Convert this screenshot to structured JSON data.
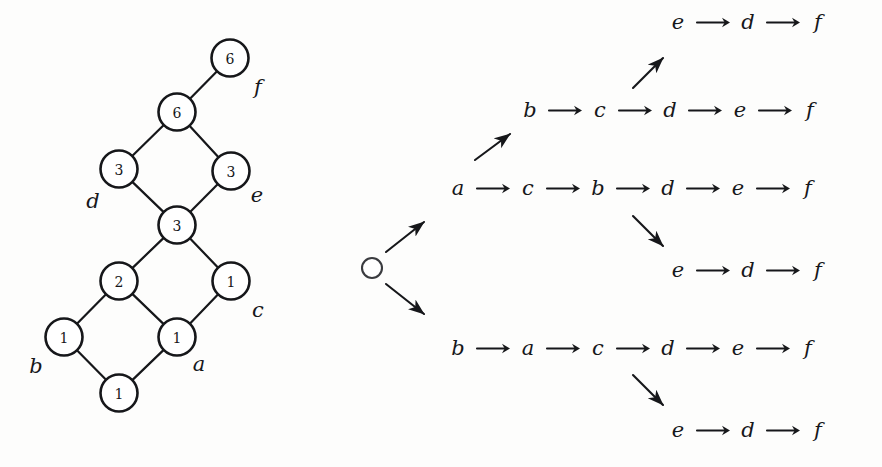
{
  "figure": {
    "caption": "",
    "ink_color": "#16171a",
    "background_color": "#fdfdfc"
  },
  "lattice": {
    "name": "counting-lattice",
    "nodes": [
      {
        "id": "n6top",
        "value": "6",
        "cx": 230,
        "cy": 58
      },
      {
        "id": "n6",
        "value": "6",
        "cx": 177,
        "cy": 112
      },
      {
        "id": "n3left",
        "value": "3",
        "cx": 119,
        "cy": 169
      },
      {
        "id": "n3right",
        "value": "3",
        "cx": 231,
        "cy": 171
      },
      {
        "id": "n3mid",
        "value": "3",
        "cx": 177,
        "cy": 225
      },
      {
        "id": "n2",
        "value": "2",
        "cx": 119,
        "cy": 281
      },
      {
        "id": "n1c",
        "value": "1",
        "cx": 231,
        "cy": 281
      },
      {
        "id": "n1b",
        "value": "1",
        "cx": 64,
        "cy": 337
      },
      {
        "id": "n1a",
        "value": "1",
        "cx": 177,
        "cy": 337
      },
      {
        "id": "n1bot",
        "value": "1",
        "cx": 119,
        "cy": 393
      }
    ],
    "edges": [
      [
        "n1bot",
        "n1b"
      ],
      [
        "n1bot",
        "n1a"
      ],
      [
        "n1b",
        "n2"
      ],
      [
        "n1a",
        "n2"
      ],
      [
        "n1a",
        "n1c"
      ],
      [
        "n2",
        "n3mid"
      ],
      [
        "n1c",
        "n3mid"
      ],
      [
        "n3mid",
        "n3left"
      ],
      [
        "n3mid",
        "n3right"
      ],
      [
        "n3left",
        "n6"
      ],
      [
        "n3right",
        "n6"
      ],
      [
        "n6",
        "n6top"
      ]
    ],
    "element_labels": [
      {
        "text": "b",
        "x": 36,
        "y": 366
      },
      {
        "text": "a",
        "x": 199,
        "y": 364
      },
      {
        "text": "c",
        "x": 258,
        "y": 310
      },
      {
        "text": "d",
        "x": 93,
        "y": 201
      },
      {
        "text": "e",
        "x": 257,
        "y": 195
      },
      {
        "text": "f",
        "x": 258,
        "y": 87
      }
    ]
  },
  "tree": {
    "name": "linear-extension-tree",
    "root": {
      "label": "",
      "cx": 42,
      "cy": 268,
      "r": 10
    },
    "rows": [
      {
        "id": "row-e-d-f-top",
        "items": [
          "e",
          "d",
          "f"
        ],
        "left": 338,
        "top": 22
      },
      {
        "id": "row-b-c-d-e-f",
        "items": [
          "b",
          "c",
          "d",
          "e",
          "f"
        ],
        "left": 190,
        "top": 110
      },
      {
        "id": "row-a-c-b-d-e-f",
        "items": [
          "a",
          "c",
          "b",
          "d",
          "e",
          "f"
        ],
        "left": 118,
        "top": 188
      },
      {
        "id": "row-e-d-f-mid",
        "items": [
          "e",
          "d",
          "f"
        ],
        "left": 338,
        "top": 270
      },
      {
        "id": "row-b-a-c-d-e-f",
        "items": [
          "b",
          "a",
          "c",
          "d",
          "e",
          "f"
        ],
        "left": 118,
        "top": 348
      },
      {
        "id": "row-e-d-f-bottom",
        "items": [
          "e",
          "d",
          "f"
        ],
        "left": 338,
        "top": 430
      }
    ],
    "branch_arrows": [
      {
        "id": "root-up",
        "x1": 56,
        "y1": 252,
        "x2": 94,
        "y2": 222
      },
      {
        "id": "root-down",
        "x1": 56,
        "y1": 284,
        "x2": 94,
        "y2": 314
      },
      {
        "id": "to-row-2",
        "x1": 145,
        "y1": 160,
        "x2": 180,
        "y2": 134
      },
      {
        "id": "to-row-1",
        "x1": 303,
        "y1": 88,
        "x2": 333,
        "y2": 58
      },
      {
        "id": "to-row-4",
        "x1": 303,
        "y1": 216,
        "x2": 333,
        "y2": 246
      },
      {
        "id": "to-row-6",
        "x1": 303,
        "y1": 375,
        "x2": 333,
        "y2": 405
      }
    ]
  }
}
